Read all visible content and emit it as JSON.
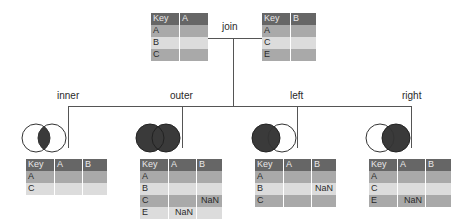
{
  "diagram": {
    "title": "join",
    "inputs": [
      {
        "name": "left-input-table",
        "columns": [
          "Key",
          "A"
        ],
        "rows": [
          [
            "A",
            ""
          ],
          [
            "B",
            ""
          ],
          [
            "C",
            ""
          ]
        ]
      },
      {
        "name": "right-input-table",
        "columns": [
          "Key",
          "B"
        ],
        "rows": [
          [
            "A",
            ""
          ],
          [
            "C",
            ""
          ],
          [
            "E",
            ""
          ]
        ]
      }
    ],
    "joins": [
      {
        "label": "inner",
        "venn": "intersection",
        "columns": [
          "Key",
          "A",
          "B"
        ],
        "rows": [
          [
            "A",
            "",
            ""
          ],
          [
            "C",
            "",
            ""
          ]
        ]
      },
      {
        "label": "outer",
        "venn": "union",
        "columns": [
          "Key",
          "A",
          "B"
        ],
        "rows": [
          [
            "A",
            "",
            ""
          ],
          [
            "B",
            "",
            ""
          ],
          [
            "C",
            "",
            "NaN"
          ],
          [
            "E",
            "NaN",
            ""
          ]
        ]
      },
      {
        "label": "left",
        "venn": "left",
        "columns": [
          "Key",
          "A",
          "B"
        ],
        "rows": [
          [
            "A",
            "",
            ""
          ],
          [
            "B",
            "",
            "NaN"
          ],
          [
            "C",
            "",
            ""
          ]
        ]
      },
      {
        "label": "right",
        "venn": "right",
        "columns": [
          "Key",
          "A",
          "B"
        ],
        "rows": [
          [
            "A",
            "",
            ""
          ],
          [
            "C",
            "",
            ""
          ],
          [
            "E",
            "NaN",
            ""
          ]
        ]
      }
    ],
    "colors": {
      "header": "#666666",
      "row_dark": "#a9a9a9",
      "row_light": "#dcdcdc",
      "venn_fill": "#3a3a3a",
      "line": "#555555"
    }
  }
}
